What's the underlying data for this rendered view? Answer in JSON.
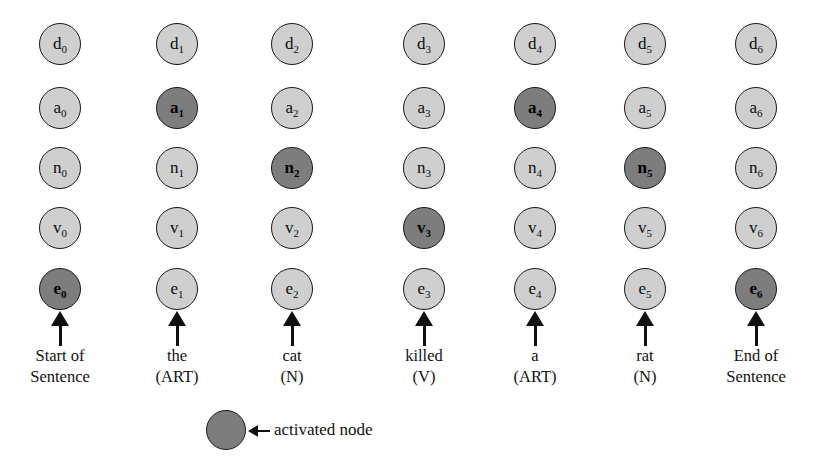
{
  "figure": {
    "colors": {
      "active_fill": "#7d7d7d",
      "inactive_fill": "#cfcfcf",
      "outline": "#1a1a1a",
      "background": "#ffffff",
      "text": "#111111"
    },
    "rows": [
      {
        "key": "d",
        "prefix": "d"
      },
      {
        "key": "a",
        "prefix": "a"
      },
      {
        "key": "n",
        "prefix": "n"
      },
      {
        "key": "v",
        "prefix": "v"
      },
      {
        "key": "e",
        "prefix": "e"
      }
    ],
    "columns": [
      {
        "index": 0,
        "x": 60,
        "word_line1": "Start of",
        "word_line2": "Sentence",
        "nodes": [
          {
            "row": "d",
            "label_base": "d",
            "label_sub": "0",
            "state": "inactive"
          },
          {
            "row": "a",
            "label_base": "a",
            "label_sub": "0",
            "state": "inactive"
          },
          {
            "row": "n",
            "label_base": "n",
            "label_sub": "0",
            "state": "inactive"
          },
          {
            "row": "v",
            "label_base": "v",
            "label_sub": "0",
            "state": "inactive"
          },
          {
            "row": "e",
            "label_base": "e",
            "label_sub": "0",
            "state": "active"
          }
        ]
      },
      {
        "index": 1,
        "x": 177,
        "word_line1": "the",
        "word_line2": "(ART)",
        "nodes": [
          {
            "row": "d",
            "label_base": "d",
            "label_sub": "1",
            "state": "inactive"
          },
          {
            "row": "a",
            "label_base": "a",
            "label_sub": "1",
            "state": "active"
          },
          {
            "row": "n",
            "label_base": "n",
            "label_sub": "1",
            "state": "inactive"
          },
          {
            "row": "v",
            "label_base": "v",
            "label_sub": "1",
            "state": "inactive"
          },
          {
            "row": "e",
            "label_base": "e",
            "label_sub": "1",
            "state": "inactive"
          }
        ]
      },
      {
        "index": 2,
        "x": 292,
        "word_line1": "cat",
        "word_line2": "(N)",
        "nodes": [
          {
            "row": "d",
            "label_base": "d",
            "label_sub": "2",
            "state": "inactive"
          },
          {
            "row": "a",
            "label_base": "a",
            "label_sub": "2",
            "state": "inactive"
          },
          {
            "row": "n",
            "label_base": "n",
            "label_sub": "2",
            "state": "active"
          },
          {
            "row": "v",
            "label_base": "v",
            "label_sub": "2",
            "state": "inactive"
          },
          {
            "row": "e",
            "label_base": "e",
            "label_sub": "2",
            "state": "inactive"
          }
        ]
      },
      {
        "index": 3,
        "x": 424,
        "word_line1": "killed",
        "word_line2": "(V)",
        "nodes": [
          {
            "row": "d",
            "label_base": "d",
            "label_sub": "3",
            "state": "inactive"
          },
          {
            "row": "a",
            "label_base": "a",
            "label_sub": "3",
            "state": "inactive"
          },
          {
            "row": "n",
            "label_base": "n",
            "label_sub": "3",
            "state": "inactive"
          },
          {
            "row": "v",
            "label_base": "v",
            "label_sub": "3",
            "state": "active"
          },
          {
            "row": "e",
            "label_base": "e",
            "label_sub": "3",
            "state": "inactive"
          }
        ]
      },
      {
        "index": 4,
        "x": 535,
        "word_line1": "a",
        "word_line2": "(ART)",
        "nodes": [
          {
            "row": "d",
            "label_base": "d",
            "label_sub": "4",
            "state": "inactive"
          },
          {
            "row": "a",
            "label_base": "a",
            "label_sub": "4",
            "state": "active"
          },
          {
            "row": "n",
            "label_base": "n",
            "label_sub": "4",
            "state": "inactive"
          },
          {
            "row": "v",
            "label_base": "v",
            "label_sub": "4",
            "state": "inactive"
          },
          {
            "row": "e",
            "label_base": "e",
            "label_sub": "4",
            "state": "inactive"
          }
        ]
      },
      {
        "index": 5,
        "x": 645,
        "word_line1": "rat",
        "word_line2": "(N)",
        "nodes": [
          {
            "row": "d",
            "label_base": "d",
            "label_sub": "5",
            "state": "inactive"
          },
          {
            "row": "a",
            "label_base": "a",
            "label_sub": "5",
            "state": "inactive"
          },
          {
            "row": "n",
            "label_base": "n",
            "label_sub": "5",
            "state": "active"
          },
          {
            "row": "v",
            "label_base": "v",
            "label_sub": "5",
            "state": "inactive"
          },
          {
            "row": "e",
            "label_base": "e",
            "label_sub": "5",
            "state": "inactive"
          }
        ]
      },
      {
        "index": 6,
        "x": 756,
        "word_line1": "End of",
        "word_line2": "Sentence",
        "nodes": [
          {
            "row": "d",
            "label_base": "d",
            "label_sub": "6",
            "state": "inactive"
          },
          {
            "row": "a",
            "label_base": "a",
            "label_sub": "6",
            "state": "inactive"
          },
          {
            "row": "n",
            "label_base": "n",
            "label_sub": "6",
            "state": "inactive"
          },
          {
            "row": "v",
            "label_base": "v",
            "label_sub": "6",
            "state": "inactive"
          },
          {
            "row": "e",
            "label_base": "e",
            "label_sub": "6",
            "state": "active"
          }
        ]
      }
    ],
    "row_y": {
      "d": 44,
      "a": 108,
      "n": 168,
      "v": 228,
      "e": 289
    },
    "arrow_y": 311,
    "word_y": 345,
    "legend": {
      "label": "activated node",
      "circle_x": 226,
      "circle_y": 430,
      "arrow_x": 248,
      "arrow_y": 424,
      "text_x": 274,
      "text_y": 420
    }
  }
}
